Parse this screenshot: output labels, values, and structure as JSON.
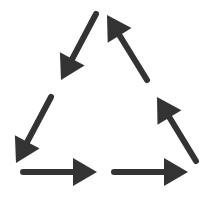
{
  "diagram": {
    "type": "cycle",
    "shape": "triangle",
    "colors": {
      "background": "#ffffff",
      "arrow": "#333333"
    },
    "arrows": [
      {
        "id": "left-upper",
        "side": "left",
        "direction": "down-left",
        "x1": 96,
        "y1": 14,
        "x2": 61,
        "y2": 80
      },
      {
        "id": "left-lower",
        "side": "left",
        "direction": "down-left",
        "x1": 51,
        "y1": 97,
        "x2": 16,
        "y2": 163
      },
      {
        "id": "bottom-left",
        "side": "bottom",
        "direction": "right",
        "x1": 23,
        "y1": 172,
        "x2": 97,
        "y2": 172
      },
      {
        "id": "bottom-right",
        "side": "bottom",
        "direction": "right",
        "x1": 114,
        "y1": 172,
        "x2": 188,
        "y2": 172
      },
      {
        "id": "right-lower",
        "side": "right",
        "direction": "up-left",
        "x1": 196,
        "y1": 161,
        "x2": 157,
        "y2": 97
      },
      {
        "id": "right-upper",
        "side": "right",
        "direction": "up-left",
        "x1": 147,
        "y1": 80,
        "x2": 107,
        "y2": 15
      }
    ],
    "stroke_width": 6,
    "head_length": 24,
    "head_width": 28
  }
}
